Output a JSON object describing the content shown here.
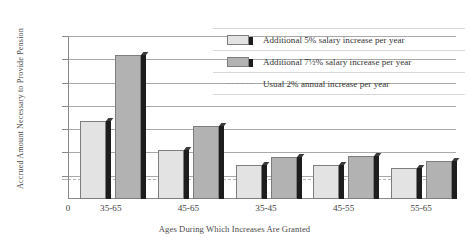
{
  "chart_data": {
    "type": "bar",
    "title": "",
    "xlabel": "Ages During Which Increases Are Granted",
    "ylabel": "Accrued Amount Necessary to Provide Pension",
    "categories": [
      "35-65",
      "45-65",
      "35-45",
      "45-55",
      "55-65"
    ],
    "series": [
      {
        "name": "Additional 5% salary increase per year",
        "color": "#e3e3e3",
        "values": [
          335000,
          210000,
          145000,
          145000,
          135000
        ]
      },
      {
        "name": "Additional 7½% salary increase per year",
        "color": "#b2b2b2",
        "values": [
          618000,
          315000,
          180000,
          185000,
          162000
        ]
      }
    ],
    "reference_line": {
      "name": "Usual 2% annual increase per year",
      "value": 84900,
      "style": "dashed",
      "color": "#9a9a9a"
    },
    "ylim": [
      0,
      700000
    ],
    "ytick_values": [
      700000,
      600000,
      500000,
      400000,
      300000,
      200000,
      100000,
      84900
    ],
    "ytick_labels": [
      "$700,000",
      "600,000",
      "500,000",
      "400,000",
      "300,000",
      "200,000",
      "100,000",
      "84,900"
    ],
    "xtick_labels": [
      "0",
      "35-65",
      "45-65",
      "35-45",
      "45-55",
      "55-65"
    ],
    "grid": true,
    "legend_position": "top-right"
  },
  "axes": {
    "y_title": "Accrued Amount Necessary to Provide Pension",
    "x_title": "Ages During Which Increases Are Granted",
    "y_ticks": [
      {
        "label": "$700,000",
        "value": 700000
      },
      {
        "label": "600,000",
        "value": 600000
      },
      {
        "label": "500,000",
        "value": 500000
      },
      {
        "label": "400,000",
        "value": 400000
      },
      {
        "label": "300,000",
        "value": 300000
      },
      {
        "label": "200,000",
        "value": 200000
      },
      {
        "label": "100,000",
        "value": 100000
      },
      {
        "label": "84,900",
        "value": 84900
      }
    ],
    "x_origin_label": "0",
    "x_ticks": [
      {
        "label": "35-65"
      },
      {
        "label": "45-65"
      },
      {
        "label": "35-45"
      },
      {
        "label": "45-55"
      },
      {
        "label": "55-65"
      }
    ]
  },
  "legend": {
    "items": [
      {
        "label": "Additional 5% salary increase per year",
        "swatch": "light-gray-bar"
      },
      {
        "label": "Additional 7½% salary increase per year",
        "swatch": "medium-gray-bar"
      },
      {
        "label": "Usual 2% annual increase per year",
        "swatch": "dashed-line"
      }
    ]
  },
  "colors": {
    "series_5pct": "#e3e3e3",
    "series_75pct": "#b2b2b2",
    "bar_shadow": "#1d1d1d",
    "gridline": "#a9a9a9",
    "reference_line": "#9a9a9a",
    "text": "#3a3a3a"
  }
}
